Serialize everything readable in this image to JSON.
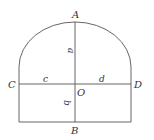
{
  "diagram": {
    "points": {
      "A": "A",
      "B": "B",
      "C": "C",
      "D": "D",
      "O": "O"
    },
    "segments": {
      "a": "a",
      "b": "b",
      "c": "c",
      "d": "d"
    },
    "stroke_color": "#555555"
  }
}
